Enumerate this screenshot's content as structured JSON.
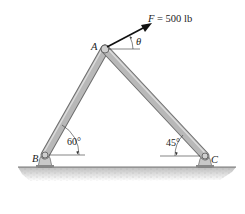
{
  "diagram": {
    "type": "statics-frame",
    "force": {
      "symbol": "F",
      "equals": " = 500 lb",
      "magnitude": 500,
      "unit": "lb",
      "angle_symbol": "θ"
    },
    "points": {
      "A": {
        "label": "A"
      },
      "B": {
        "label": "B"
      },
      "C": {
        "label": "C"
      }
    },
    "angles": {
      "B": {
        "label": "60°",
        "value": 60
      },
      "C": {
        "label": "45°",
        "value": 45
      }
    },
    "members": [
      "AB",
      "AC"
    ],
    "supports": [
      "pin-B",
      "pin-C"
    ]
  },
  "colors": {
    "member_fill": "#b8b8b8",
    "member_edge": "#6e6e6e",
    "ground": "#cfcfcf",
    "line": "#1a1a1a"
  }
}
